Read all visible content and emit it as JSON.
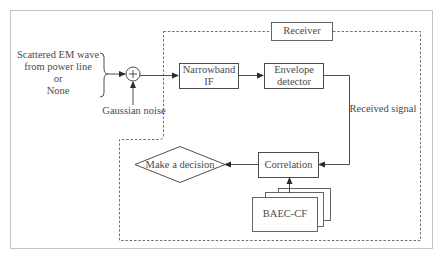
{
  "diagram": {
    "input": {
      "lines": [
        "Scattered EM wave",
        "from power line",
        "or",
        "None"
      ]
    },
    "noise_label": "Gaussian noise",
    "summing_junction_symbol": "+",
    "receiver_label": "Receiver",
    "blocks": {
      "narrowband_if": [
        "Narrowband",
        "IF"
      ],
      "envelope_detector": [
        "Envelope",
        "detector"
      ],
      "correlation": "Correlation",
      "baec_cf": "BAEC-CF",
      "decision": "Make a decision"
    },
    "signal_label": "Received signal",
    "colors": {
      "line": "#3a3a3a",
      "frame": "#bdbdbd",
      "dashed": "#6a6a6a",
      "text": "#4a4a4a"
    }
  }
}
